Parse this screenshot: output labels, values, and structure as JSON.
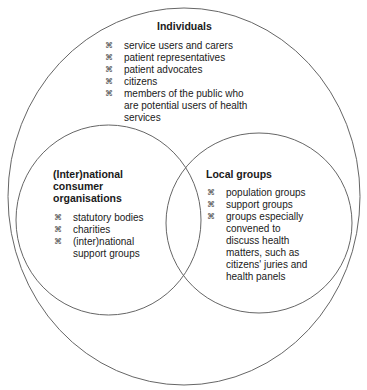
{
  "diagram": {
    "type": "venn",
    "bullet_icon": "⌘",
    "colors": {
      "stroke": "#666666",
      "text": "#1a1a1a",
      "background": "#ffffff"
    },
    "outer": {
      "title": "Individuals",
      "items": [
        [
          "service users and carers"
        ],
        [
          "patient representatives"
        ],
        [
          "patient advocates"
        ],
        [
          "citizens"
        ],
        [
          "members of the public who",
          "are potential users of health",
          "services"
        ]
      ]
    },
    "left": {
      "title_lines": [
        "(Inter)national",
        "consumer",
        "organisations"
      ],
      "items": [
        [
          "statutory bodies"
        ],
        [
          "charities"
        ],
        [
          "(inter)national",
          "support groups"
        ]
      ]
    },
    "right": {
      "title_lines": [
        "Local groups"
      ],
      "items": [
        [
          "population groups"
        ],
        [
          "support groups"
        ],
        [
          "groups especially",
          "convened to",
          "discuss health",
          "matters, such as",
          "citizens' juries and",
          "health panels"
        ]
      ]
    }
  }
}
